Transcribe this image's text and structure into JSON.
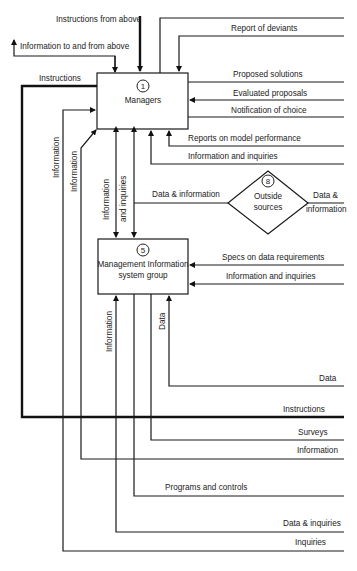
{
  "nodes": {
    "managers": {
      "number": "1",
      "label": "Managers"
    },
    "mis": {
      "number": "5",
      "label_line1": "Management Information",
      "label_line2": "system group"
    },
    "outside": {
      "number": "8",
      "label_line1": "Outside",
      "label_line2": "sources"
    }
  },
  "flows": {
    "instructions_from_above": "Instructions from above",
    "info_to_from_above": "Information to and from above",
    "instructions_left": "Instructions",
    "report_of_deviants": "Report of deviants",
    "proposed_solutions": "Proposed solutions",
    "evaluated_proposals": "Evaluated proposals",
    "notification_of_choice": "Notification of choice",
    "reports_model_performance": "Reports on model performance",
    "info_and_inquiries_top": "Information and inquiries",
    "data_and_information_left": "Data & information",
    "data_and_information_right_1": "Data &",
    "data_and_information_right_2": "information",
    "specs_data_requirements": "Specs on data requirements",
    "info_and_inquiries_mis": "Information and inquiries",
    "vertical_information_1": "Information",
    "vertical_information_2": "Information",
    "vertical_info_inquiries_1": "Information",
    "vertical_info_inquiries_2": "and inquiries",
    "vertical_information_mis": "Information",
    "vertical_data_mis": "Data",
    "data_bottom": "Data",
    "instructions_bottom": "Instructions",
    "surveys": "Surveys",
    "information_bottom": "Information",
    "programs_and_controls": "Programs and controls",
    "data_and_inquiries": "Data & inquiries",
    "inquiries": "Inquiries"
  }
}
